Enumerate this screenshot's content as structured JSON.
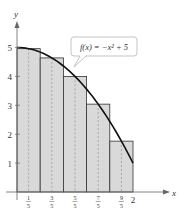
{
  "chart_data": {
    "type": "bar",
    "title": "",
    "xlabel": "x",
    "ylabel": "y",
    "xlim": [
      0,
      2.15
    ],
    "ylim": [
      0,
      5.5
    ],
    "grid": false,
    "function_label": "f(x) = −x² + 5",
    "function": "-x^2+5",
    "bar_width": 0.4,
    "categories": [
      "1/5",
      "3/5",
      "5/5",
      "7/5",
      "9/5"
    ],
    "midpoints": [
      0.2,
      0.6,
      1.0,
      1.4,
      1.8
    ],
    "values": [
      4.96,
      4.64,
      4.0,
      3.04,
      1.76
    ],
    "bar_edges": [
      0,
      0.4,
      0.8,
      1.2,
      1.6,
      2.0
    ],
    "y_ticks": [
      "1",
      "2",
      "3",
      "4",
      "5"
    ],
    "x_ticks": [
      {
        "num": "1",
        "den": "5"
      },
      {
        "num": "3",
        "den": "5"
      },
      {
        "num": "5",
        "den": "5"
      },
      {
        "num": "7",
        "den": "5"
      },
      {
        "num": "9",
        "den": "5"
      }
    ],
    "x_end_tick": "2",
    "colors": {
      "bar_fill": "#d9d9d9",
      "bar_stroke": "#333333",
      "curve": "#111111",
      "dashed": "#888888"
    }
  }
}
